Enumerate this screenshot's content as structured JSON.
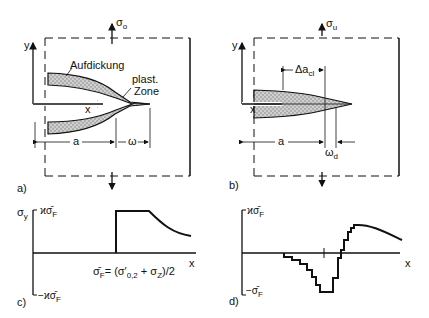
{
  "panels": {
    "a": {
      "label": "a)",
      "stress_arrow": "σ",
      "stress_sub": "o",
      "axis_y": "y",
      "axis_x": "x",
      "annotation_thickening": "Aufdickung",
      "annotation_plastic_1": "plast.",
      "annotation_plastic_2": "Zone",
      "dim_a": "a",
      "dim_omega": "ω"
    },
    "b": {
      "label": "b)",
      "stress_arrow": "σ",
      "stress_sub": "u",
      "axis_y": "y",
      "axis_x": "x",
      "dim_delta_a": "Δa",
      "dim_delta_a_sub": "cl",
      "dim_a": "a",
      "dim_omega": "ω",
      "dim_omega_sub": "d"
    },
    "c": {
      "label": "c)",
      "axis_y": "σ",
      "axis_y_sub": "y",
      "axis_x": "x",
      "top_tick": "ϰσ̄",
      "top_tick_sub": "F",
      "bottom_tick": "−ϰσ̄",
      "bottom_tick_sub": "F",
      "formula": "σ̄",
      "formula_sub": "F",
      "formula_rest": "= (σ′",
      "formula_sub2": "0,2",
      "formula_rest2": " + σ",
      "formula_sub3": "Z",
      "formula_end": ")/2"
    },
    "d": {
      "label": "d)",
      "axis_x": "x",
      "top_tick": "ϰσ̄",
      "top_tick_sub": "F",
      "bottom_tick": "−σ̄",
      "bottom_tick_sub": "F"
    }
  }
}
